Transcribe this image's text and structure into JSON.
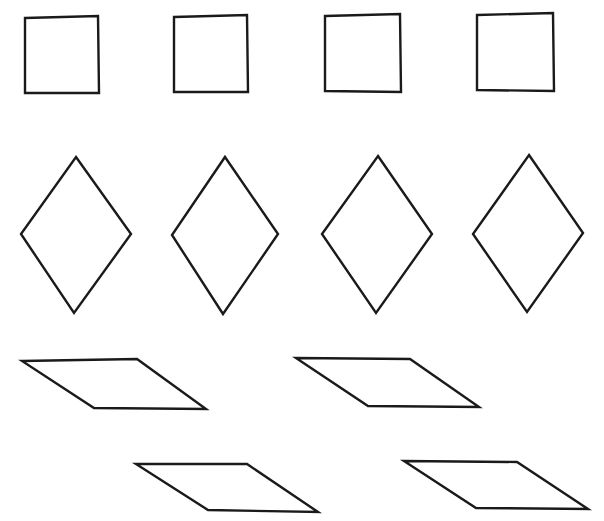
{
  "figure": {
    "title": "Geometric shapes worksheet figure",
    "background_color": "#ffffff",
    "stroke_color": "#1a1a1a",
    "fill_color": "#ffffff",
    "stroke_width": 2.4,
    "width": 604,
    "height": 521
  },
  "groups": [
    {
      "name": "squares-row",
      "label": "Row of squares",
      "shape_type": "square",
      "count": 4
    },
    {
      "name": "rhombuses-row",
      "label": "Row of rhombuses",
      "shape_type": "rhombus",
      "count": 4
    },
    {
      "name": "parallelograms-rows",
      "label": "Rows of parallelograms",
      "shape_type": "parallelogram",
      "count": 4
    }
  ],
  "shapes": [
    {
      "id": "square-1",
      "label": "Square 1",
      "type": "square",
      "row": 1,
      "points": "25,18 98,16 99,93 25,93"
    },
    {
      "id": "square-2",
      "label": "Square 2",
      "type": "square",
      "row": 1,
      "points": "174,17 247,15 248,92 174,92"
    },
    {
      "id": "square-3",
      "label": "Square 3",
      "type": "square",
      "row": 1,
      "points": "325,16 400,14 401,92 325,91"
    },
    {
      "id": "square-4",
      "label": "Square 4",
      "type": "square",
      "row": 1,
      "points": "477,15 553,13 554,91 477,90"
    },
    {
      "id": "rhombus-1",
      "label": "Rhombus 1",
      "type": "rhombus",
      "row": 2,
      "points": "76,157 131,234 74,313 21,234"
    },
    {
      "id": "rhombus-2",
      "label": "Rhombus 2",
      "type": "rhombus",
      "row": 2,
      "points": "225,157 278,234 223,314 172,235"
    },
    {
      "id": "rhombus-3",
      "label": "Rhombus 3",
      "type": "rhombus",
      "row": 2,
      "points": "378,156 432,234 376,313 322,234"
    },
    {
      "id": "rhombus-4",
      "label": "Rhombus 4",
      "type": "rhombus",
      "row": 2,
      "points": "529,155 583,233 527,312 473,234"
    },
    {
      "id": "parallelogram-1",
      "label": "Parallelogram 1",
      "type": "parallelogram",
      "row": 3,
      "points": "22,361 137,359 206,409 94,408"
    },
    {
      "id": "parallelogram-2",
      "label": "Parallelogram 2",
      "type": "parallelogram",
      "row": 3,
      "points": "296,358 410,359 479,407 368,406"
    },
    {
      "id": "parallelogram-3",
      "label": "Parallelogram 3",
      "type": "parallelogram",
      "row": 4,
      "points": "136,464 247,464 318,512 208,510"
    },
    {
      "id": "parallelogram-4",
      "label": "Parallelogram 4",
      "type": "parallelogram",
      "row": 4,
      "points": "404,461 517,462 588,509 476,508"
    }
  ]
}
